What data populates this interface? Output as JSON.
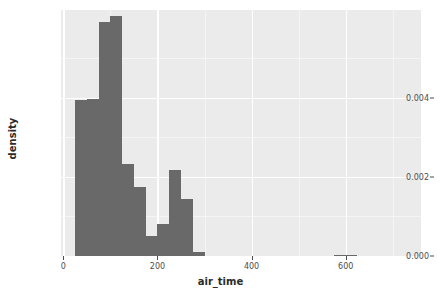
{
  "chart_data": {
    "type": "bar",
    "title": "",
    "subtitle": "",
    "xlabel": "air_time",
    "ylabel": "density",
    "xlim": [
      -5,
      760
    ],
    "ylim": [
      0.0,
      0.00622
    ],
    "grid": true,
    "legend": null,
    "binwidth": 25,
    "annotations": [],
    "x_ticks": [
      {
        "value": 0,
        "label": "0"
      },
      {
        "value": 200,
        "label": "200"
      },
      {
        "value": 400,
        "label": "400"
      },
      {
        "value": 600,
        "label": "600"
      }
    ],
    "y_ticks": [
      {
        "value": 0.0,
        "label": "0.000"
      },
      {
        "value": 0.002,
        "label": "0.002"
      },
      {
        "value": 0.004,
        "label": "0.004"
      }
    ],
    "bars": [
      {
        "bin_start": 25,
        "bin_end": 50,
        "center": 37.5,
        "value": 0.00395
      },
      {
        "bin_start": 50,
        "bin_end": 75,
        "center": 62.5,
        "value": 0.00397
      },
      {
        "bin_start": 75,
        "bin_end": 100,
        "center": 87.5,
        "value": 0.00592
      },
      {
        "bin_start": 100,
        "bin_end": 125,
        "center": 112.5,
        "value": 0.00608
      },
      {
        "bin_start": 125,
        "bin_end": 150,
        "center": 137.5,
        "value": 0.00232
      },
      {
        "bin_start": 150,
        "bin_end": 175,
        "center": 162.5,
        "value": 0.00175
      },
      {
        "bin_start": 175,
        "bin_end": 200,
        "center": 187.5,
        "value": 0.0005
      },
      {
        "bin_start": 200,
        "bin_end": 225,
        "center": 212.5,
        "value": 0.00082
      },
      {
        "bin_start": 225,
        "bin_end": 250,
        "center": 237.5,
        "value": 0.00218
      },
      {
        "bin_start": 250,
        "bin_end": 275,
        "center": 262.5,
        "value": 0.00143
      },
      {
        "bin_start": 275,
        "bin_end": 300,
        "center": 287.5,
        "value": 0.00011
      },
      {
        "bin_start": 300,
        "bin_end": 325,
        "center": 312.5,
        "value": 1e-05
      },
      {
        "bin_start": 575,
        "bin_end": 600,
        "center": 587.5,
        "value": 3e-05
      },
      {
        "bin_start": 600,
        "bin_end": 625,
        "center": 612.5,
        "value": 2e-05
      }
    ],
    "colors": {
      "bar_fill": "#696969",
      "panel_background": "#ebebeb",
      "gridline": "#ffffff",
      "axis_text": "#4d4d4d",
      "axis_title": "#2b2b2b",
      "figure_background": "#ffffff"
    }
  }
}
